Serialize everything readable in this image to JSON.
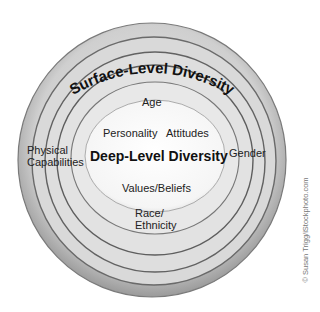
{
  "diagram": {
    "type": "onion-layers",
    "outer_title": "Surface-Level Diversity",
    "inner_title": "Deep-Level Diversity",
    "surface_level_items": [
      "Age",
      "Gender",
      "Physical Capabilities",
      "Race/ Ethnicity"
    ],
    "deep_level_items": [
      "Personality",
      "Attitudes",
      "Values/Beliefs"
    ],
    "labels": {
      "age": "Age",
      "personality": "Personality",
      "attitudes": "Attitudes",
      "physical_line1": "Physical",
      "physical_line2": "Capabilities",
      "gender": "Gender",
      "values": "Values/Beliefs",
      "race_line1": "Race/",
      "race_line2": "Ethnicity"
    },
    "credit": "© Susan Trigg/iStockphoto.com",
    "colors": {
      "ring_fill": "#d6d6d6",
      "ring_edge": "#6a6a6a",
      "core": "#fbfbfb"
    }
  }
}
